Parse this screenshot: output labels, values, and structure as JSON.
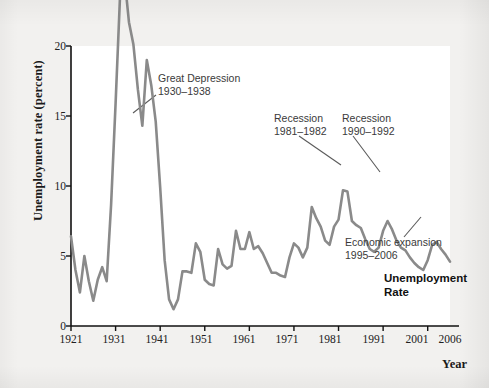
{
  "chart_data": {
    "type": "line",
    "title": "Unemployment Rate",
    "xlabel": "Year",
    "ylabel": "Unemployment rate (percent)",
    "xlim": [
      1921,
      2006
    ],
    "ylim": [
      0,
      20
    ],
    "grid": false,
    "legend_position": "none",
    "line_color": "#8a8a8a",
    "axis_color": "#111111",
    "xticks": [
      "1921",
      "1931",
      "1941",
      "1951",
      "1961",
      "1971",
      "1981",
      "1991",
      "2001",
      "2006"
    ],
    "yticks": [
      "0",
      "5",
      "10",
      "15",
      "20"
    ],
    "series": [
      {
        "name": "Unemployment Rate",
        "x": [
          1921,
          1922,
          1923,
          1924,
          1925,
          1926,
          1927,
          1928,
          1929,
          1930,
          1931,
          1932,
          1933,
          1934,
          1935,
          1936,
          1937,
          1938,
          1939,
          1940,
          1941,
          1942,
          1943,
          1944,
          1945,
          1946,
          1947,
          1948,
          1949,
          1950,
          1951,
          1952,
          1953,
          1954,
          1955,
          1956,
          1957,
          1958,
          1959,
          1960,
          1961,
          1962,
          1963,
          1964,
          1965,
          1966,
          1967,
          1968,
          1969,
          1970,
          1971,
          1972,
          1973,
          1974,
          1975,
          1976,
          1977,
          1978,
          1979,
          1980,
          1981,
          1982,
          1983,
          1984,
          1985,
          1986,
          1987,
          1988,
          1989,
          1990,
          1991,
          1992,
          1993,
          1994,
          1995,
          1996,
          1997,
          1998,
          1999,
          2000,
          2001,
          2002,
          2003,
          2004,
          2005,
          2006
        ],
        "values": [
          6.4,
          4.0,
          2.4,
          5.0,
          3.2,
          1.8,
          3.3,
          4.2,
          3.2,
          8.7,
          15.9,
          23.6,
          24.9,
          21.7,
          20.1,
          16.9,
          14.3,
          19.0,
          17.2,
          14.6,
          9.9,
          4.7,
          1.9,
          1.2,
          1.9,
          3.9,
          3.9,
          3.8,
          5.9,
          5.3,
          3.3,
          3.0,
          2.9,
          5.5,
          4.4,
          4.1,
          4.3,
          6.8,
          5.5,
          5.5,
          6.7,
          5.5,
          5.7,
          5.2,
          4.5,
          3.8,
          3.8,
          3.6,
          3.5,
          4.9,
          5.9,
          5.6,
          4.9,
          5.6,
          8.5,
          7.7,
          7.1,
          6.1,
          5.8,
          7.1,
          7.6,
          9.7,
          9.6,
          7.5,
          7.2,
          7.0,
          6.2,
          5.5,
          5.3,
          5.6,
          6.8,
          7.5,
          6.9,
          6.1,
          5.6,
          5.4,
          4.9,
          4.5,
          4.2,
          4.0,
          4.7,
          5.8,
          6.0,
          5.5,
          5.1,
          4.6
        ]
      }
    ],
    "annotations": [
      {
        "id": "great-depression",
        "text": "Great Depression\n1930–1938",
        "label_x": 158,
        "label_y": 72,
        "leader_from": [
          156,
          95
        ],
        "leader_to": [
          133,
          113
        ]
      },
      {
        "id": "recession-1981",
        "text": "Recession\n1981–1982",
        "label_x": 274,
        "label_y": 112,
        "leader_from": [
          299,
          136
        ],
        "leader_to": [
          341,
          165
        ]
      },
      {
        "id": "recession-1990",
        "text": "Recession\n1990–1992",
        "label_x": 342,
        "label_y": 112,
        "leader_from": [
          353,
          136
        ],
        "leader_to": [
          380,
          172
        ]
      },
      {
        "id": "economic-expansion",
        "text": "Economic expansion\n1995–2006",
        "label_x": 345,
        "label_y": 236,
        "leader_from": [
          404,
          237
        ],
        "leader_to": [
          421,
          217
        ]
      }
    ],
    "series_title_position": {
      "x": 384,
      "y": 272
    }
  }
}
